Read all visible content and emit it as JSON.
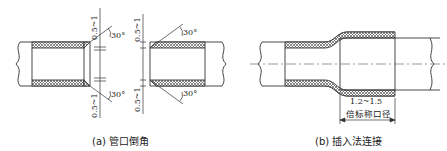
{
  "figures": [
    {
      "id": "a",
      "caption": "(a) 管口倒角",
      "labels": {
        "dim_top_left": "0.5~1",
        "dim_bottom_left": "0.5~1",
        "dim_top_right": "0.5~1",
        "dim_bottom_right": "0.5~1",
        "angle_top_left": "30°",
        "angle_bottom_left": "30°",
        "angle_top_right": "30°",
        "angle_bottom_right": "30°"
      }
    },
    {
      "id": "b",
      "caption": "(b) 插入法连接",
      "labels": {
        "dim_value": "1.2~1.5",
        "dim_unit": "倍标称口径"
      }
    }
  ],
  "colors": {
    "line": "#333333",
    "hatch": "#555555"
  }
}
